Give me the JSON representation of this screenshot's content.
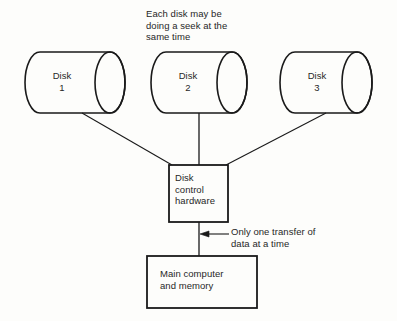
{
  "diagram": {
    "colors": {
      "stroke": "#1a1a1a",
      "text": "#272727",
      "background": "#fdfdfb"
    },
    "disks": [
      {
        "id": "disk-1",
        "line1": "Disk",
        "line2": "1",
        "text": "Disk\n1"
      },
      {
        "id": "disk-2",
        "line1": "Disk",
        "line2": "2",
        "text": "Disk\n2"
      },
      {
        "id": "disk-3",
        "line1": "Disk",
        "line2": "3",
        "text": "Disk\n3"
      }
    ],
    "boxes": {
      "controller": {
        "text": "Disk\ncontrol\nhardware",
        "line1": "Disk",
        "line2": "control",
        "line3": "hardware"
      },
      "main_computer": {
        "text": "Main computer\nand memory",
        "line1": "Main computer",
        "line2": "and memory"
      }
    },
    "annotations": {
      "seek_note": {
        "text": "Each disk may be\ndoing a seek at the\nsame time",
        "line1": "Each disk may be",
        "line2": "doing a seek at the",
        "line3": "same time"
      },
      "transfer_note": {
        "text": "Only one transfer of\ndata at a time",
        "line1": "Only one transfer of",
        "line2": "data at a time"
      }
    }
  }
}
